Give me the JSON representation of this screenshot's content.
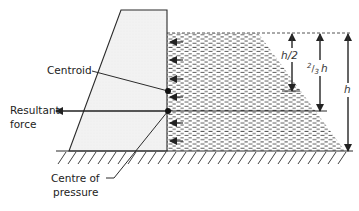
{
  "diagram": {
    "labels": {
      "centroid": "Centroid",
      "resultant_line1": "Resultant",
      "resultant_line2": "force",
      "cop_line1": "Centre of",
      "cop_line2": "pressure"
    },
    "dimensions": {
      "half_h": "h/2",
      "two_thirds_num": "2",
      "two_thirds_den": "3",
      "two_thirds_var": "h",
      "full_h": "h"
    },
    "colors": {
      "stroke": "#2b2b2b",
      "dam_fill": "#f1f1f1",
      "water_dash": "#555555",
      "background": "#ffffff"
    }
  }
}
